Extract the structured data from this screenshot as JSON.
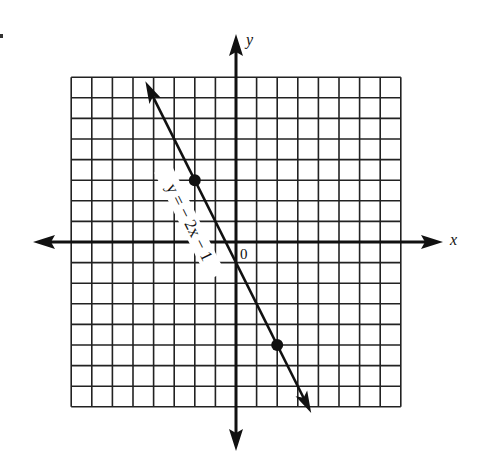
{
  "chart_data": {
    "type": "line",
    "title": "",
    "xlabel": "x",
    "ylabel": "y",
    "origin_label": "0",
    "xlim": [
      -8,
      8
    ],
    "ylim": [
      -8,
      8
    ],
    "grid": true,
    "grid_step": 1,
    "series": [
      {
        "name": "y = − 2x − 1",
        "equation": "y = -2x - 1",
        "slope": -2,
        "intercept": -1,
        "x_range": [
          -4.4,
          3.65
        ],
        "marked_points": [
          {
            "x": -2,
            "y": 3
          },
          {
            "x": 2,
            "y": -5
          }
        ]
      }
    ],
    "legend": "none (inline label along line)"
  },
  "labels": {
    "x_axis": "x",
    "y_axis": "y",
    "origin": "0",
    "equation": "y = − 2x − 1"
  },
  "colors": {
    "ink": "#111111",
    "grid": "#222222",
    "background": "#ffffff"
  }
}
